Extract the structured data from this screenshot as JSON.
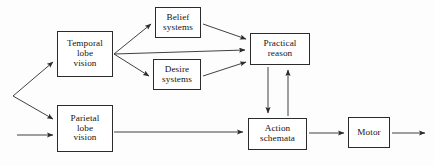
{
  "diagram": {
    "background_color": "#fdfdfd",
    "line_color": "#2b2b2b",
    "text_color": "#141414",
    "nodes": [
      {
        "id": "temporal",
        "lines": [
          "Temporal",
          "lobe",
          "vision"
        ],
        "line1": "Temporal",
        "line2": "lobe",
        "line3": "vision"
      },
      {
        "id": "belief",
        "lines": [
          "Belief",
          "systems"
        ],
        "line1": "Belief",
        "line2": "systems"
      },
      {
        "id": "desire",
        "lines": [
          "Desire",
          "systems"
        ],
        "line1": "Desire",
        "line2": "systems"
      },
      {
        "id": "practical",
        "lines": [
          "Practical",
          "reason"
        ],
        "line1": "Practical",
        "line2": "reason"
      },
      {
        "id": "parietal",
        "lines": [
          "Parietal",
          "lobe",
          "vision"
        ],
        "line1": "Parietal",
        "line2": "lobe",
        "line3": "vision"
      },
      {
        "id": "action",
        "lines": [
          "Action",
          "schemata"
        ],
        "line1": "Action",
        "line2": "schemata"
      },
      {
        "id": "motor",
        "lines": [
          "Motor"
        ],
        "line1": "Motor"
      }
    ],
    "edges": [
      {
        "id": "input-fork-to-temporal",
        "from": "input-fork",
        "to": "temporal",
        "label": ""
      },
      {
        "id": "input-fork-to-parietal",
        "from": "input-fork",
        "to": "parietal",
        "label": ""
      },
      {
        "id": "input-arrow-to-parietal",
        "from": "external-input",
        "to": "parietal",
        "label": ""
      },
      {
        "id": "temporal-to-belief",
        "from": "temporal",
        "to": "belief",
        "label": ""
      },
      {
        "id": "temporal-to-practical",
        "from": "temporal",
        "to": "practical",
        "label": ""
      },
      {
        "id": "temporal-to-desire",
        "from": "temporal",
        "to": "desire",
        "label": ""
      },
      {
        "id": "belief-to-practical",
        "from": "belief",
        "to": "practical",
        "label": ""
      },
      {
        "id": "desire-to-practical",
        "from": "desire",
        "to": "practical",
        "label": ""
      },
      {
        "id": "practical-to-action",
        "from": "practical",
        "to": "action",
        "label": ""
      },
      {
        "id": "action-to-practical",
        "from": "action",
        "to": "practical",
        "label": ""
      },
      {
        "id": "parietal-to-action",
        "from": "parietal",
        "to": "action",
        "label": ""
      },
      {
        "id": "action-to-motor",
        "from": "action",
        "to": "motor",
        "label": ""
      },
      {
        "id": "motor-to-output",
        "from": "motor",
        "to": "external-output",
        "label": ""
      }
    ]
  }
}
